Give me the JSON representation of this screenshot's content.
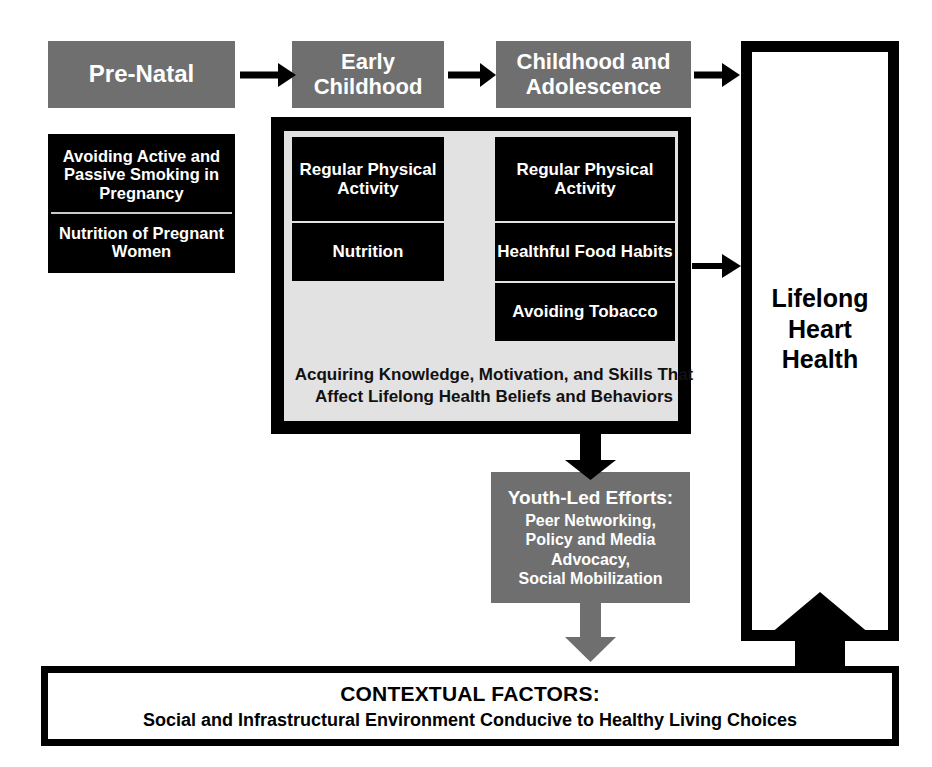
{
  "diagram": {
    "colors": {
      "stage_fill": "#6f6f6f",
      "factor_fill": "#000000",
      "panel_fill": "#e2e2e2",
      "arrow_black": "#000000",
      "arrow_grey": "#6f6f6f",
      "text_light": "#ffffff",
      "text_dark": "#000000"
    }
  },
  "stages": {
    "prenatal": "Pre-Natal",
    "early_childhood": "Early\nChildhood",
    "childhood_adolescence": "Childhood and\nAdolescence"
  },
  "prenatal_factors": [
    "Avoiding Active and Passive Smoking in Pregnancy",
    "Nutrition of Pregnant Women"
  ],
  "early_childhood_factors": [
    "Regular Physical Activity",
    "Nutrition"
  ],
  "childhood_adolescence_factors": [
    "Regular Physical Activity",
    "Healthful Food Habits",
    "Avoiding Tobacco"
  ],
  "panel_caption": "Acquiring Knowledge, Motivation, and Skills That Affect Lifelong Health Beliefs and Behaviors",
  "youth_efforts": {
    "title": "Youth-Led Efforts:",
    "body": "Peer Networking,\nPolicy and Media\nAdvocacy,\nSocial Mobilization"
  },
  "outcome": {
    "label": "Lifelong\nHeart\nHealth"
  },
  "contextual_factors": {
    "title": "CONTEXTUAL FACTORS:",
    "subtitle": "Social and Infrastructural Environment Conducive to Healthy Living Choices"
  },
  "arrows": [
    {
      "name": "prenatal-to-early",
      "style": "black-thin"
    },
    {
      "name": "early-to-childhood",
      "style": "black-thin"
    },
    {
      "name": "childhood-to-lifelong",
      "style": "black-thin"
    },
    {
      "name": "panel-to-lifelong",
      "style": "black-thin"
    },
    {
      "name": "panel-to-youth",
      "style": "black-thick"
    },
    {
      "name": "youth-to-context",
      "style": "grey-thick"
    },
    {
      "name": "context-to-lifelong",
      "style": "black-extra-thick"
    }
  ]
}
